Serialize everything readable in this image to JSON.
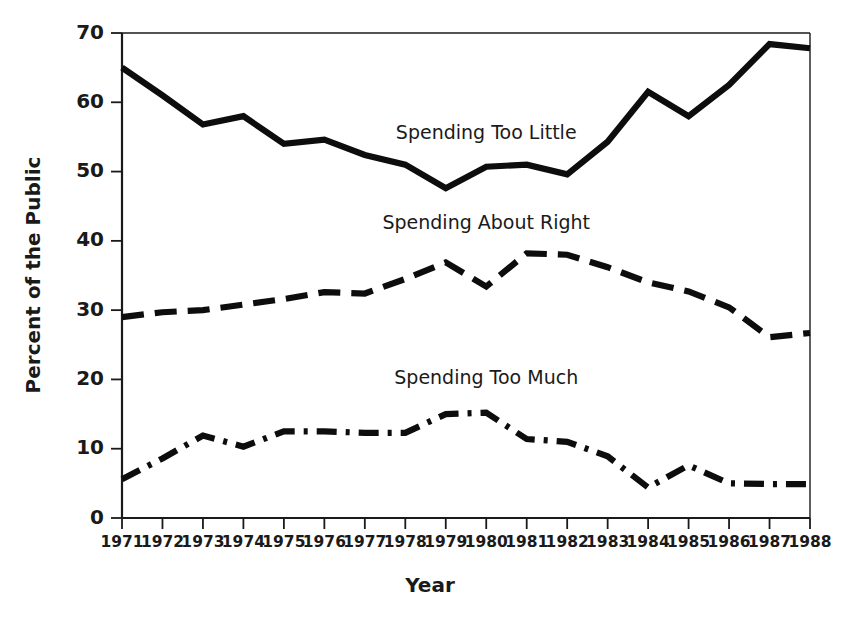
{
  "chart_data": {
    "type": "line",
    "title": "",
    "xlabel": "Year",
    "ylabel": "Percent of the Public",
    "xlim": [
      1971,
      1988
    ],
    "ylim": [
      0,
      70
    ],
    "yticks": [
      0,
      10,
      20,
      30,
      40,
      50,
      60,
      70
    ],
    "grid": false,
    "legend": "inline-labels",
    "categories": [
      1971,
      1972,
      1973,
      1974,
      1975,
      1976,
      1977,
      1978,
      1979,
      1980,
      1981,
      1982,
      1983,
      1984,
      1985,
      1986,
      1987,
      1988
    ],
    "xtick_labels": [
      "1971",
      "1972",
      "1973",
      "1974",
      "1975",
      "1976",
      "1977",
      "1978",
      "1979",
      "1980",
      "1981",
      "1982",
      "1983",
      "1984",
      "1985",
      "1986",
      "1987",
      "1988"
    ],
    "ytick_labels": [
      "0",
      "10",
      "20",
      "30",
      "40",
      "50",
      "60",
      "70"
    ],
    "series": [
      {
        "name": "Spending Too Little",
        "style": "solid",
        "color": "#0d0d0d",
        "label_x": 1980,
        "label_y": 55.5,
        "values": [
          65.0,
          61.0,
          56.8,
          58.0,
          54.0,
          54.6,
          52.4,
          51.0,
          47.6,
          50.7,
          51.0,
          49.6,
          54.3,
          61.5,
          58.0,
          62.5,
          68.4,
          67.8
        ]
      },
      {
        "name": "Spending About Right",
        "style": "dashed",
        "color": "#0d0d0d",
        "label_x": 1980,
        "label_y": 42.5,
        "values": [
          29.0,
          29.7,
          30.0,
          30.8,
          31.6,
          32.6,
          32.4,
          34.5,
          36.9,
          33.4,
          38.2,
          38.0,
          36.2,
          34.0,
          32.7,
          30.4,
          26.1,
          26.7
        ]
      },
      {
        "name": "Spending Too Much",
        "style": "dashdot",
        "color": "#0d0d0d",
        "label_x": 1980,
        "label_y": 20.2,
        "values": [
          5.6,
          8.6,
          11.9,
          10.3,
          12.5,
          12.5,
          12.3,
          12.3,
          15.0,
          15.2,
          11.4,
          11.0,
          8.9,
          4.4,
          7.6,
          5.0,
          4.9,
          4.9
        ]
      }
    ]
  }
}
